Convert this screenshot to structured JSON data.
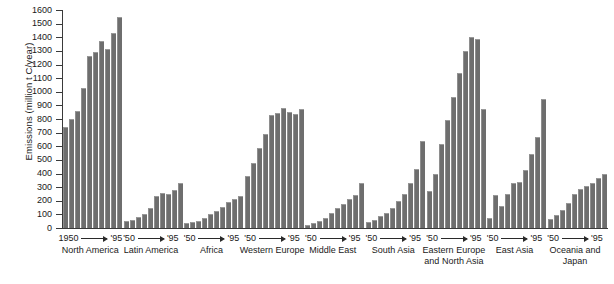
{
  "chart_data": {
    "type": "bar",
    "title": "",
    "xlabel": "",
    "ylabel": "Emissions (million t C/year)",
    "ylim": [
      0,
      1600
    ],
    "ytick_step": 100,
    "yticks": [
      "0",
      "100",
      "200",
      "300",
      "400",
      "500",
      "600",
      "700",
      "800",
      "900",
      "1000",
      "1100",
      "1200",
      "1300",
      "1400",
      "1500",
      "1600"
    ],
    "grid": false,
    "legend": "none",
    "bar_color": "#6e6e6e",
    "axis_color": "#3a3a3a",
    "x_period_note": "Each group shows 10 bars spanning 1950 to 1995 in 5-year steps",
    "x_years": [
      "1950",
      "1955",
      "1960",
      "1965",
      "1970",
      "1975",
      "1980",
      "1985",
      "1990",
      "1995"
    ],
    "groups": [
      {
        "name": "North America",
        "range_start": "1950",
        "range_end": "'95",
        "values": [
          740,
          800,
          860,
          1025,
          1265,
          1295,
          1375,
          1315,
          1430,
          1550
        ]
      },
      {
        "name": "Latin America",
        "range_start": "'50",
        "range_end": "'95",
        "values": [
          50,
          60,
          80,
          105,
          150,
          235,
          260,
          250,
          280,
          330
        ]
      },
      {
        "name": "Africa",
        "range_start": "'50",
        "range_end": "'95",
        "values": [
          35,
          45,
          55,
          75,
          100,
          125,
          155,
          190,
          210,
          235
        ]
      },
      {
        "name": "Western Europe",
        "range_start": "'50",
        "range_end": "'95",
        "values": [
          385,
          475,
          590,
          690,
          830,
          845,
          880,
          855,
          840,
          870
        ]
      },
      {
        "name": "Middle East",
        "range_start": "'50",
        "range_end": "'95",
        "values": [
          25,
          35,
          55,
          75,
          110,
          150,
          175,
          215,
          245,
          330
        ]
      },
      {
        "name": "South Asia",
        "range_start": "'50",
        "range_end": "'95",
        "values": [
          45,
          60,
          85,
          110,
          150,
          195,
          250,
          330,
          430,
          640
        ]
      },
      {
        "name": "Eastern Europe and North Asia",
        "range_start": "'50",
        "range_end": "'95",
        "values": [
          270,
          400,
          620,
          790,
          965,
          1135,
          1300,
          1405,
          1390,
          870
        ]
      },
      {
        "name": "East Asia",
        "range_start": "'50",
        "range_end": "'95",
        "values": [
          75,
          240,
          160,
          250,
          330,
          340,
          425,
          545,
          665,
          950
        ]
      },
      {
        "name": "Oceania and Japan",
        "range_start": "'50",
        "range_end": "'95",
        "values": [
          65,
          95,
          130,
          185,
          250,
          285,
          305,
          330,
          365,
          400
        ]
      }
    ]
  }
}
